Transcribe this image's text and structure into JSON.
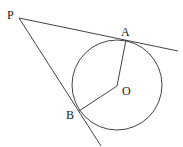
{
  "diagram": {
    "type": "geometry",
    "points": {
      "P": {
        "label": "P",
        "x": 19,
        "y": 18
      },
      "A": {
        "label": "A",
        "x": 126,
        "y": 40
      },
      "B": {
        "label": "B",
        "x": 79,
        "y": 111
      },
      "O": {
        "label": "O",
        "x": 117,
        "y": 86
      }
    },
    "circle": {
      "center": "O",
      "cx": 117,
      "cy": 85,
      "r": 45
    },
    "segments": [
      {
        "from": "P",
        "to": "A",
        "kind": "tangent",
        "extended": true
      },
      {
        "from": "P",
        "to": "B",
        "kind": "tangent",
        "extended": true
      },
      {
        "from": "O",
        "to": "A",
        "kind": "radius"
      },
      {
        "from": "O",
        "to": "B",
        "kind": "radius"
      }
    ],
    "colors": {
      "stroke": "#444444",
      "text": "#222222",
      "background": "#ffffff"
    }
  }
}
